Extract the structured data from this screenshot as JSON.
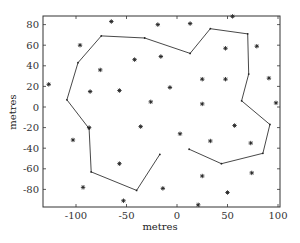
{
  "chart_data": {
    "type": "scatter",
    "title": "",
    "xlabel": "metres",
    "ylabel": "metres",
    "xlim": [
      -135,
      102
    ],
    "ylim": [
      -98,
      90
    ],
    "xticks": [
      -100,
      -50,
      0,
      50,
      100
    ],
    "yticks": [
      -80,
      -60,
      -40,
      -20,
      0,
      20,
      40,
      60,
      80
    ],
    "grid": false,
    "legend": null,
    "series": [
      {
        "name": "points",
        "marker": "star",
        "points": [
          [
            -127,
            22
          ],
          [
            -65,
            83
          ],
          [
            -96,
            60
          ],
          [
            -76,
            36
          ],
          [
            -86,
            15
          ],
          [
            -57,
            16
          ],
          [
            -19,
            80
          ],
          [
            13,
            81
          ],
          [
            -42,
            46
          ],
          [
            -16,
            49
          ],
          [
            55,
            88
          ],
          [
            48,
            57
          ],
          [
            79,
            59
          ],
          [
            -7,
            19
          ],
          [
            25,
            27
          ],
          [
            -26,
            5
          ],
          [
            25,
            3
          ],
          [
            48,
            27
          ],
          [
            91,
            28
          ],
          [
            98,
            4
          ],
          [
            -87,
            -20
          ],
          [
            -103,
            -32
          ],
          [
            -36,
            -19
          ],
          [
            3,
            -26
          ],
          [
            33,
            -33
          ],
          [
            57,
            -18
          ],
          [
            73,
            -35
          ],
          [
            -93,
            -78
          ],
          [
            -57,
            -55
          ],
          [
            -53,
            -91
          ],
          [
            -14,
            -79
          ],
          [
            25,
            -67
          ],
          [
            21,
            -95
          ],
          [
            74,
            -64
          ],
          [
            50,
            -83
          ]
        ]
      },
      {
        "name": "path",
        "marker": "line",
        "points": [
          [
            -17,
            -46
          ],
          [
            -40,
            -81
          ],
          [
            -85,
            -63
          ],
          [
            -87,
            -21
          ],
          [
            -109,
            7
          ],
          [
            -98,
            43
          ],
          [
            -75,
            69
          ],
          [
            -32,
            67
          ],
          [
            13,
            52
          ],
          [
            33,
            76
          ],
          [
            70,
            71
          ],
          [
            71,
            32
          ],
          [
            64,
            6
          ],
          [
            92,
            -17
          ],
          [
            85,
            -45
          ],
          [
            44,
            -55
          ],
          [
            12,
            -41
          ]
        ]
      }
    ]
  }
}
